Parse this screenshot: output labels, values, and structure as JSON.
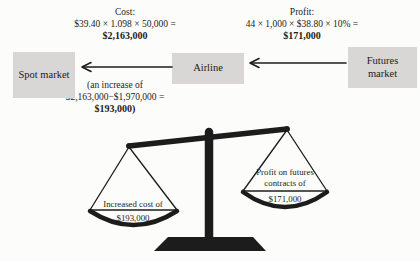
{
  "figure": {
    "cost_note": {
      "label": "Cost:",
      "formula": "$39.40 × 1.098 × 50,000 =",
      "result": "$2,163,000"
    },
    "profit_note": {
      "label": "Profit:",
      "formula": "44 × 1,000 × $38.80 × 10% =",
      "result": "$171,000"
    },
    "increase_note": {
      "line1": "(an increase of",
      "line2": "$2,163,000−$1,970,000 =",
      "line3": "$193,000)"
    },
    "boxes": {
      "spot": "Spot market",
      "airline": "Airline",
      "futures": "Futures market"
    },
    "scale": {
      "left_pan_line1": "Increased cost of",
      "left_pan_amount": "$193,000",
      "right_pan_line1": "Profit on futures",
      "right_pan_line2": "contracts of",
      "right_pan_amount": "$171,000"
    },
    "colors": {
      "box_bg": "#d8d7d5",
      "ink": "#1c1c1c",
      "paper": "#fcfcfa"
    }
  }
}
